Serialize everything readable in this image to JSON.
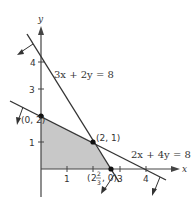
{
  "diagram": {
    "type": "linear-programming-feasible-region",
    "axes": {
      "x_label": "x",
      "y_label": "y",
      "x_ticks": [
        "1",
        "2",
        "3",
        "4"
      ],
      "y_ticks": [
        "1",
        "2",
        "3",
        "4"
      ]
    },
    "lines": [
      {
        "equation": "3x + 2y = 8",
        "intercepts": {
          "x": "8/3",
          "y": 4
        }
      },
      {
        "equation": "2x + 4y = 8",
        "intercepts": {
          "x": 4,
          "y": 2
        }
      }
    ],
    "vertices": [
      {
        "label": "(0, 2)",
        "x": 0,
        "y": 2
      },
      {
        "label": "(2, 1)",
        "x": 2,
        "y": 1
      },
      {
        "label": "(8/3, 0)",
        "x": 2.667,
        "y": 0,
        "display_whole": "2",
        "display_num": "2",
        "display_den": "3"
      }
    ],
    "feasible_region": {
      "vertices": [
        [
          0,
          0
        ],
        [
          0,
          2
        ],
        [
          2,
          1
        ],
        [
          2.667,
          0
        ]
      ],
      "fill": "#c8c8c8"
    },
    "colors": {
      "line": "#333333",
      "axis": "#444444",
      "region": "#c8c8c8",
      "point": "#111111"
    }
  }
}
